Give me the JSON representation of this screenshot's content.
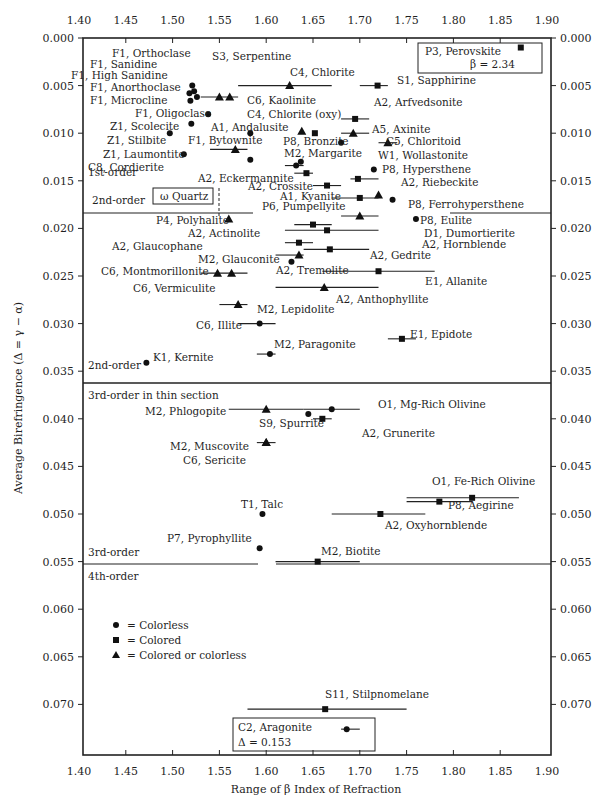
{
  "chart_data": {
    "type": "scatter",
    "title": "",
    "xlabel": "Range of β Index of Refraction",
    "ylabel": "Average Birefringence (Δ = γ − α)",
    "xlim": [
      1.4,
      1.9
    ],
    "ylim": [
      0.0,
      0.077
    ],
    "y_inverted": true,
    "grid": false,
    "x_ticks": [
      "1.40",
      "1.45",
      "1.50",
      "1.55",
      "1.60",
      "1.65",
      "1.70",
      "1.75",
      "1.80",
      "1.85",
      "1.90"
    ],
    "y_ticks": [
      "0.000",
      "0.005",
      "0.010",
      "0.015",
      "0.020",
      "0.025",
      "0.030",
      "0.035",
      "0.040",
      "0.045",
      "0.050",
      "0.055",
      "0.060",
      "0.065",
      "0.070"
    ],
    "legend": {
      "position": "lower-left",
      "entries": [
        {
          "marker": "circle",
          "label": "= Colorless"
        },
        {
          "marker": "square",
          "label": "= Colored"
        },
        {
          "marker": "triangle",
          "label": "= Colored or colorless"
        }
      ]
    },
    "order_boundaries": [
      {
        "y": 0.018,
        "above": "1st-order",
        "below": "2nd-order",
        "x_to": 1.75
      },
      {
        "y": 0.0345,
        "above": "2nd-order",
        "below": "3rd-order in thin section"
      },
      {
        "y": 0.055,
        "above": "3rd-order",
        "below": "4th-order"
      }
    ],
    "points": [
      {
        "label": "F1, Orthoclase",
        "x": 1.521,
        "y": 0.005,
        "marker": "circle"
      },
      {
        "label": "F1, Sanidine",
        "x": 1.523,
        "y": 0.0056,
        "marker": "circle"
      },
      {
        "label": "F1, High Sanidine",
        "x": 1.518,
        "y": 0.0058,
        "marker": "circle"
      },
      {
        "label": "F1, Anorthoclase",
        "x": 1.526,
        "y": 0.0062,
        "marker": "circle"
      },
      {
        "label": "F1, Microcline",
        "x": 1.519,
        "y": 0.0066,
        "marker": "circle"
      },
      {
        "label": "S3, Serpentine",
        "x": 1.55,
        "y": 0.0062,
        "x_min": 1.53,
        "x_max": 1.57,
        "marker": "triangle"
      },
      {
        "label": "C6, Kaolinite",
        "x": 1.561,
        "y": 0.0062,
        "marker": "triangle"
      },
      {
        "label": "C4, Chlorite",
        "x": 1.625,
        "y": 0.005,
        "x_min": 1.57,
        "x_max": 1.67,
        "marker": "triangle"
      },
      {
        "label": "S1, Sapphirine",
        "x": 1.719,
        "y": 0.005,
        "x_min": 1.7,
        "x_max": 1.73,
        "marker": "square"
      },
      {
        "label": "P3, Perovskite",
        "x": 1.872,
        "y": 0.001,
        "note": "β = 2.34",
        "marker": "square"
      },
      {
        "label": "A2, Arfvedsonite",
        "x": 1.695,
        "y": 0.0085,
        "x_min": 1.68,
        "x_max": 1.71,
        "marker": "square"
      },
      {
        "label": "F1, Oligoclase",
        "x": 1.538,
        "y": 0.008,
        "marker": "circle"
      },
      {
        "label": "C4, Chlorite (oxy)",
        "x": 1.652,
        "y": 0.01,
        "marker": "square"
      },
      {
        "label": "A1, Andalusite",
        "x": 1.638,
        "y": 0.0098,
        "marker": "triangle"
      },
      {
        "label": "A5, Axinite",
        "x": 1.693,
        "y": 0.01,
        "x_min": 1.68,
        "x_max": 1.71,
        "marker": "triangle"
      },
      {
        "label": "Z1, Scolecite",
        "x": 1.52,
        "y": 0.009,
        "marker": "circle"
      },
      {
        "label": "Z1, Stilbite",
        "x": 1.497,
        "y": 0.01,
        "marker": "circle"
      },
      {
        "label": "A1, Andalusite (pt)",
        "x": 1.583,
        "y": 0.01,
        "marker": "circle"
      },
      {
        "label": "P8, Bronzite",
        "x": 1.68,
        "y": 0.011,
        "marker": "circle"
      },
      {
        "label": "C5, Chloritoid",
        "x": 1.73,
        "y": 0.011,
        "x_min": 1.72,
        "x_max": 1.74,
        "marker": "triangle"
      },
      {
        "label": "F1, Bytownite",
        "x": 1.567,
        "y": 0.0117,
        "x_min": 1.54,
        "x_max": 1.58,
        "marker": "triangle"
      },
      {
        "label": "Z1, Laumontite",
        "x": 1.512,
        "y": 0.0122,
        "marker": "circle"
      },
      {
        "label": "C8, Cordierite",
        "x": 1.583,
        "y": 0.0128,
        "marker": "circle"
      },
      {
        "label": "M2, Margarite",
        "x": 1.637,
        "y": 0.013,
        "marker": "circle"
      },
      {
        "label": "W1, Wollastonite",
        "x": 1.632,
        "y": 0.0134,
        "x_min": 1.62,
        "x_max": 1.64,
        "marker": "circle"
      },
      {
        "label": "P8, Hypersthene",
        "x": 1.715,
        "y": 0.0138,
        "marker": "circle"
      },
      {
        "label": "A2, Eckermannite",
        "x": 1.643,
        "y": 0.0142,
        "x_min": 1.63,
        "x_max": 1.65,
        "marker": "square"
      },
      {
        "label": "A2, Riebeckite",
        "x": 1.698,
        "y": 0.0148,
        "x_min": 1.69,
        "x_max": 1.72,
        "marker": "square"
      },
      {
        "label": "A2, Crossite",
        "x": 1.665,
        "y": 0.0155,
        "x_min": 1.65,
        "x_max": 1.68,
        "marker": "square"
      },
      {
        "label": "A1, Kyanite",
        "x": 1.72,
        "y": 0.0165,
        "marker": "triangle"
      },
      {
        "label": "P6, Pumpellyite",
        "x": 1.7,
        "y": 0.0168,
        "x_min": 1.67,
        "x_max": 1.72,
        "marker": "square"
      },
      {
        "label": "P8, Ferrohypersthene",
        "x": 1.735,
        "y": 0.017,
        "marker": "circle"
      },
      {
        "label": "ω Quartz",
        "x": 1.544,
        "y": 0.009,
        "marker": "none",
        "boxed": true
      },
      {
        "label": "P4, Polyhalite",
        "x": 1.56,
        "y": 0.019,
        "marker": "triangle"
      },
      {
        "label": "P8, Eulite",
        "x": 1.76,
        "y": 0.019,
        "marker": "circle"
      },
      {
        "label": "D1, Dumortierite",
        "x": 1.7,
        "y": 0.0187,
        "x_min": 1.68,
        "x_max": 1.72,
        "marker": "triangle"
      },
      {
        "label": "A2, Actinolite",
        "x": 1.65,
        "y": 0.0196,
        "x_min": 1.63,
        "x_max": 1.67,
        "marker": "square"
      },
      {
        "label": "A2, Hornblende",
        "x": 1.665,
        "y": 0.0202,
        "x_min": 1.62,
        "x_max": 1.72,
        "marker": "square"
      },
      {
        "label": "A2, Glaucophane",
        "x": 1.635,
        "y": 0.0215,
        "x_min": 1.62,
        "x_max": 1.65,
        "marker": "square"
      },
      {
        "label": "A2, Gedrite",
        "x": 1.668,
        "y": 0.0222,
        "x_min": 1.64,
        "x_max": 1.71,
        "marker": "square"
      },
      {
        "label": "M2, Glauconite",
        "x": 1.635,
        "y": 0.0228,
        "x_min": 1.61,
        "x_max": 1.64,
        "marker": "triangle"
      },
      {
        "label": "A2, Tremolite",
        "x": 1.627,
        "y": 0.0235,
        "marker": "circle"
      },
      {
        "label": "C6, Montmorillonite",
        "x": 1.548,
        "y": 0.0247,
        "x_min": 1.53,
        "x_max": 1.58,
        "marker": "triangle"
      },
      {
        "label": "C6, Vermiculite",
        "x": 1.563,
        "y": 0.0247,
        "marker": "triangle"
      },
      {
        "label": "E1, Allanite",
        "x": 1.72,
        "y": 0.0245,
        "x_min": 1.66,
        "x_max": 1.78,
        "marker": "square"
      },
      {
        "label": "A2, Anthophyllite",
        "x": 1.662,
        "y": 0.0262,
        "x_min": 1.61,
        "x_max": 1.72,
        "marker": "triangle"
      },
      {
        "label": "M2, Lepidolite",
        "x": 1.57,
        "y": 0.028,
        "x_min": 1.55,
        "x_max": 1.58,
        "marker": "triangle"
      },
      {
        "label": "C6, Illite",
        "x": 1.593,
        "y": 0.03,
        "x_min": 1.57,
        "x_max": 1.61,
        "marker": "circle"
      },
      {
        "label": "E1, Epidote",
        "x": 1.745,
        "y": 0.0316,
        "x_min": 1.73,
        "x_max": 1.76,
        "marker": "square"
      },
      {
        "label": "M2, Paragonite",
        "x": 1.604,
        "y": 0.0332,
        "x_min": 1.59,
        "x_max": 1.61,
        "marker": "circle"
      },
      {
        "label": "K1, Kernite",
        "x": 1.472,
        "y": 0.0341,
        "marker": "circle"
      },
      {
        "label": "M2, Phlogopite",
        "x": 1.6,
        "y": 0.039,
        "x_min": 1.56,
        "x_max": 1.64,
        "marker": "triangle"
      },
      {
        "label": "O1, Mg-Rich Olivine",
        "x": 1.67,
        "y": 0.039,
        "x_min": 1.64,
        "x_max": 1.7,
        "marker": "circle"
      },
      {
        "label": "S9, Spurrite",
        "x": 1.645,
        "y": 0.0395,
        "marker": "circle"
      },
      {
        "label": "A2, Grunerite",
        "x": 1.66,
        "y": 0.04,
        "x_min": 1.65,
        "x_max": 1.67,
        "marker": "square"
      },
      {
        "label": "M2, Muscovite",
        "x": 1.6,
        "y": 0.0425,
        "x_min": 1.59,
        "x_max": 1.61,
        "marker": "triangle"
      },
      {
        "label": "C6, Sericite",
        "x": 1.6,
        "y": 0.0425,
        "marker": "triangle"
      },
      {
        "label": "O1, Fe-Rich Olivine",
        "x": 1.82,
        "y": 0.0483,
        "x_min": 1.75,
        "x_max": 1.87,
        "marker": "square"
      },
      {
        "label": "P8, Aegirine",
        "x": 1.785,
        "y": 0.0487,
        "x_min": 1.75,
        "x_max": 1.82,
        "marker": "square"
      },
      {
        "label": "T1, Talc",
        "x": 1.596,
        "y": 0.05,
        "marker": "circle"
      },
      {
        "label": "A2, Oxyhornblende",
        "x": 1.722,
        "y": 0.05,
        "x_min": 1.67,
        "x_max": 1.77,
        "marker": "square"
      },
      {
        "label": "P7, Pyrophyllite",
        "x": 1.593,
        "y": 0.0536,
        "marker": "circle"
      },
      {
        "label": "M2, Biotite",
        "x": 1.655,
        "y": 0.055,
        "x_min": 1.61,
        "x_max": 1.7,
        "marker": "square"
      },
      {
        "label": "S11, Stilpnomelane",
        "x": 1.663,
        "y": 0.0705,
        "x_min": 1.58,
        "x_max": 1.75,
        "marker": "square"
      },
      {
        "label": "C2, Aragonite",
        "x": 1.686,
        "y": 0.0726,
        "x_min": 1.68,
        "x_max": 1.7,
        "marker": "circle",
        "note": "Δ = 0.153"
      }
    ]
  },
  "labels": {
    "order_1st": "1st-order",
    "order_2nd_top": "2nd-order",
    "order_2nd_bottom": "2nd-order",
    "order_3rd_thin": "3rd-order in thin section",
    "order_3rd": "3rd-order",
    "order_4th": "4th-order",
    "quartz_box": "ω Quartz",
    "perovskite_title": "P3, Perovskite",
    "perovskite_note": "β = 2.34",
    "aragonite_title": "C2, Aragonite",
    "aragonite_note": "Δ = 0.153",
    "legend_circle": "= Colorless",
    "legend_square": "= Colored",
    "legend_triangle": "= Colored or colorless",
    "xlabel": "Range of β Index of Refraction",
    "ylabel": "Average Birefringence (Δ = γ − α)"
  }
}
